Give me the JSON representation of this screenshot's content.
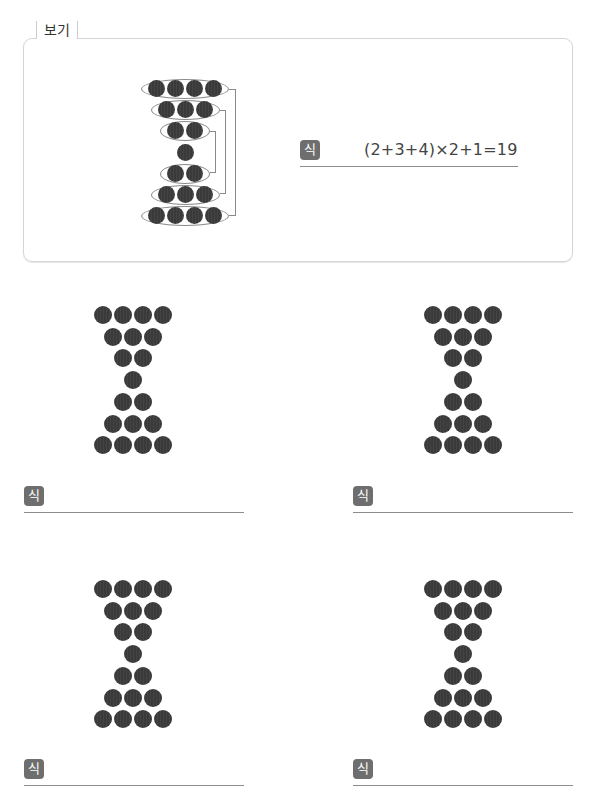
{
  "example": {
    "label": "보기",
    "badge": "식",
    "formula": "(2+3+4)×2+1=19",
    "rows": [
      4,
      3,
      2,
      1,
      2,
      3,
      4
    ]
  },
  "problems": [
    {
      "badge": "식",
      "answer": "",
      "rows": [
        4,
        3,
        2,
        1,
        2,
        3,
        4
      ]
    },
    {
      "badge": "식",
      "answer": "",
      "rows": [
        4,
        3,
        2,
        1,
        2,
        3,
        4
      ]
    },
    {
      "badge": "식",
      "answer": "",
      "rows": [
        4,
        3,
        2,
        1,
        2,
        3,
        4
      ]
    },
    {
      "badge": "식",
      "answer": "",
      "rows": [
        4,
        3,
        2,
        1,
        2,
        3,
        4
      ]
    }
  ],
  "colors": {
    "dot": "#3a3a3a",
    "badge": "#6e6e6e",
    "line": "#8c8c8c",
    "border": "#d6d6d6"
  }
}
